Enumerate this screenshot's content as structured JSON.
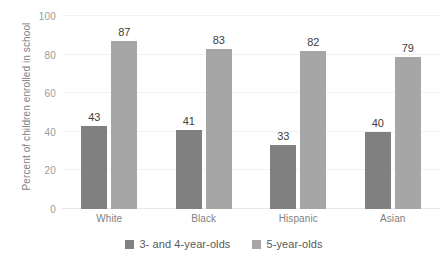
{
  "chart_data": {
    "type": "bar",
    "title": "",
    "xlabel": "",
    "ylabel": "Percent of children enrolled in school",
    "categories": [
      "White",
      "Black",
      "Hispanic",
      "Asian"
    ],
    "series": [
      {
        "name": "3- and 4-year-olds",
        "color": "#808080",
        "values": [
          43,
          41,
          33,
          40
        ]
      },
      {
        "name": "5-year-olds",
        "color": "#a6a6a6",
        "values": [
          87,
          83,
          82,
          79
        ]
      }
    ],
    "ylim": [
      0,
      100
    ],
    "yticks": [
      0,
      20,
      40,
      60,
      80,
      100
    ],
    "ytick_labels": [
      "0",
      "20",
      "40",
      "60",
      "80",
      "100"
    ],
    "grid": true,
    "legend_position": "bottom",
    "data_labels": true
  },
  "axes": {
    "y_title": "Percent of children enrolled in school"
  },
  "legend": {
    "items": [
      {
        "label": "3- and 4-year-olds"
      },
      {
        "label": "5-year-olds"
      }
    ]
  },
  "colors": {
    "series_0": "#808080",
    "series_1": "#a6a6a6",
    "gridline": "#f2f2f2",
    "tick_text": "#9c9c9c",
    "label_text": "#7f7f7f",
    "data_label_text": "#404040",
    "background": "#ffffff"
  }
}
